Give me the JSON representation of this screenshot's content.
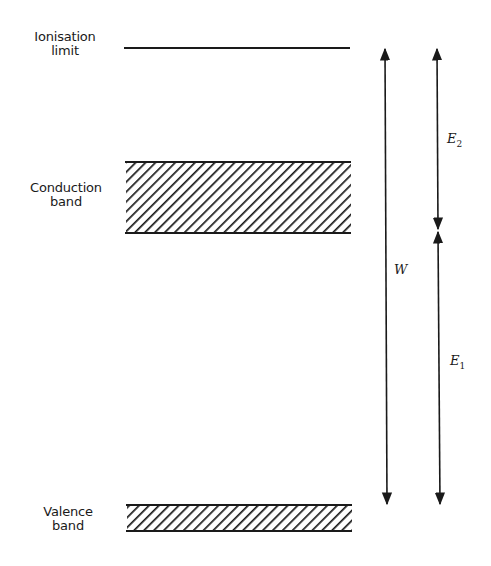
{
  "diagram": {
    "type": "energy-level-diagram",
    "levels": [
      {
        "id": "ionisation",
        "label_line1": "Ionisation",
        "label_line2": "limit",
        "kind": "line"
      },
      {
        "id": "conduction",
        "label_line1": "Conduction",
        "label_line2": "band",
        "kind": "hatched-band"
      },
      {
        "id": "valence",
        "label_line1": "Valence",
        "label_line2": "band",
        "kind": "hatched-band"
      }
    ],
    "arrows": [
      {
        "id": "W",
        "symbol": "W",
        "from": "valence",
        "to": "ionisation",
        "direction": "double"
      },
      {
        "id": "E2",
        "symbol": "E",
        "subscript": "2",
        "from": "conduction",
        "to": "ionisation",
        "direction": "double"
      },
      {
        "id": "E1",
        "symbol": "E",
        "subscript": "1",
        "from": "valence",
        "to": "conduction",
        "direction": "double"
      }
    ],
    "colors": {
      "ink": "#1a1a1a",
      "background": "#ffffff"
    }
  }
}
